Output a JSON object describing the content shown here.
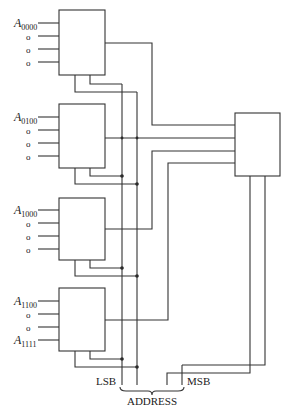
{
  "diagram": {
    "type": "multiplexer-tree",
    "input_blocks": [
      {
        "id": "mux0",
        "label_main": "A",
        "label_sub": "0000",
        "extra_inputs": [
          "o",
          "o",
          "o"
        ]
      },
      {
        "id": "mux1",
        "label_main": "A",
        "label_sub": "0100",
        "extra_inputs": [
          "o",
          "o",
          "o"
        ]
      },
      {
        "id": "mux2",
        "label_main": "A",
        "label_sub": "1000",
        "extra_inputs": [
          "o",
          "o",
          "o"
        ]
      },
      {
        "id": "mux3",
        "label_main": "A",
        "label_sub": "1100",
        "extra_inputs": [
          "o",
          "o"
        ],
        "last_label_main": "A",
        "last_label_sub": "1111"
      }
    ],
    "output_block": {
      "id": "mux-final"
    },
    "address": {
      "lsb_label": "LSB",
      "msb_label": "MSB",
      "bus_label": "ADDRESS"
    }
  }
}
